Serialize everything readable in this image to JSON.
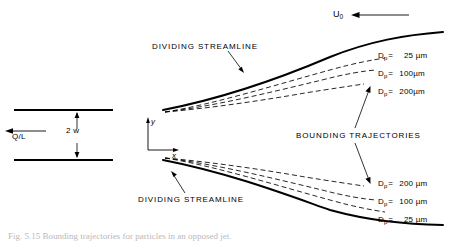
{
  "figure": {
    "inlet_flow_label": "Q/L",
    "channel_width_label": "2 w",
    "freestream_label": "U",
    "freestream_sub": "0",
    "axis_x": "x",
    "axis_y": "y",
    "dividing_streamline_top": "DIVIDING STREAMLINE",
    "dividing_streamline_bottom": "DIVIDING STREAMLINE",
    "bounding_trajectories": "BOUNDING  TRAJECTORIES",
    "particle_symbol": "D",
    "particle_sub": "p",
    "equals": "=",
    "unit": "µm",
    "top_labels": [
      {
        "symbol": "D",
        "sub": "p",
        "eq": "=",
        "value": "25",
        "unit": "µm"
      },
      {
        "symbol": "D",
        "sub": "p",
        "eq": "=",
        "value": "100",
        "unit": "µm"
      },
      {
        "symbol": "D",
        "sub": "p",
        "eq": "=",
        "value": "200",
        "unit": "µm"
      }
    ],
    "bottom_labels": [
      {
        "symbol": "D",
        "sub": "p",
        "eq": "=",
        "value": "200",
        "unit": "µm"
      },
      {
        "symbol": "D",
        "sub": "p",
        "eq": "=",
        "value": "100",
        "unit": "µm"
      },
      {
        "symbol": "D",
        "sub": "p",
        "eq": "=",
        "value": "25",
        "unit": "µm"
      }
    ],
    "caption": "Fig. 5.15   Bounding trajectories for particles in an opposed jet."
  },
  "colors": {
    "ink": "#000000",
    "caption_ink": "#b9b9b9",
    "background": "#ffffff"
  }
}
